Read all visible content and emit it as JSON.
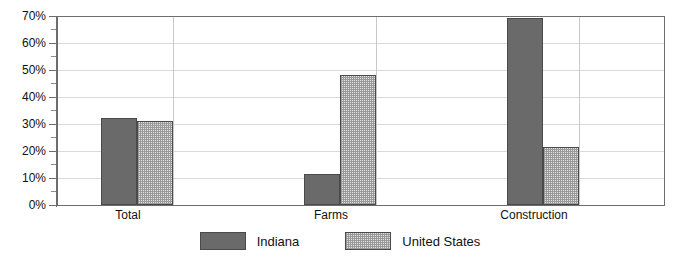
{
  "chart_data": {
    "type": "bar",
    "title": "",
    "subtitle": "",
    "xlabel": "",
    "ylabel": "",
    "categories": [
      "Total",
      "Farms",
      "Construction"
    ],
    "series": [
      {
        "name": "Indiana",
        "color": "#6a6a6a",
        "pattern": "solid",
        "values": [
          32,
          11.5,
          69
        ]
      },
      {
        "name": "United States",
        "color": "#e2e2e2",
        "pattern": "checkered-dots",
        "values": [
          31,
          48,
          21.5
        ]
      }
    ],
    "ylim": [
      0,
      70
    ],
    "ytick_labels": [
      "0%",
      "10%",
      "20%",
      "30%",
      "40%",
      "50%",
      "60%",
      "70%"
    ],
    "ytick_values": [
      0,
      10,
      20,
      30,
      40,
      50,
      60,
      70
    ],
    "yminor_tick_values": [
      5,
      15,
      25,
      35,
      45,
      55,
      65
    ],
    "grid": "horizontal",
    "legend_position": "bottom-center"
  },
  "axis": {
    "labels": {
      "y": [
        "70%",
        "60%",
        "50%",
        "40%",
        "30%",
        "20%",
        "10%",
        "0%"
      ],
      "x": [
        "Total",
        "Farms",
        "Construction"
      ]
    }
  },
  "legend": {
    "items": [
      {
        "label": "Indiana"
      },
      {
        "label": "United States"
      }
    ]
  }
}
